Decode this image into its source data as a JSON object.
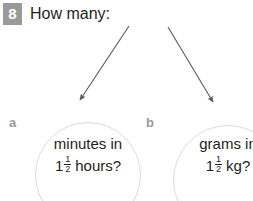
{
  "question": {
    "number": "8",
    "heading": "How many:"
  },
  "parts": [
    {
      "label": "a",
      "line1": "minutes in",
      "whole": "1",
      "numerator": "1",
      "denominator": "2",
      "unit": "hours?"
    },
    {
      "label": "b",
      "line1": "grams in",
      "whole": "1",
      "numerator": "1",
      "denominator": "2",
      "unit": "kg?"
    }
  ],
  "colors": {
    "badge_background": "#9a9a9a",
    "badge_text": "#ffffff",
    "body_text": "#231f20",
    "label_gray": "#9a9a9a",
    "circle_stroke": "#dcdcdc",
    "arrow_stroke": "#58595b"
  }
}
